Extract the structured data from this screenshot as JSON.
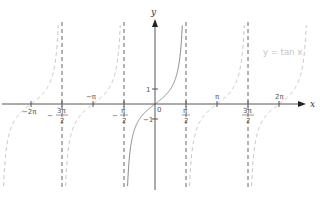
{
  "chart_data": {
    "type": "line",
    "title": "",
    "function": "y = tan x",
    "legend": "y = tan x",
    "xlabel": "x",
    "ylabel": "y",
    "x_tick_labels": [
      "−2π",
      "−3π/2",
      "−π",
      "−π/2",
      "0",
      "π/2",
      "π",
      "3π/2",
      "2π"
    ],
    "x_ticks": [
      -6.2832,
      -4.7124,
      -3.1416,
      -1.5708,
      0,
      1.5708,
      3.1416,
      4.7124,
      6.2832
    ],
    "y_tick_labels": [
      "1",
      "−1"
    ],
    "y_ticks": [
      1,
      -1
    ],
    "asymptotes": [
      -4.7124,
      -1.5708,
      1.5708,
      4.7124
    ],
    "asymptote_labels": [
      "−3π/2",
      "−π/2",
      "π/2",
      "3π/2"
    ],
    "xlim": [
      -7.5,
      8
    ],
    "ylim": [
      -6.5,
      6.5
    ],
    "grid": false,
    "legend_position": "upper right",
    "series": [
      {
        "name": "principal branch",
        "style": "solid",
        "domain": [
          -1.5708,
          1.5708
        ]
      },
      {
        "name": "other branches",
        "style": "dashed",
        "domain": [
          [
            -7.854,
            -4.7124
          ],
          [
            -4.7124,
            -1.5708
          ],
          [
            1.5708,
            4.7124
          ],
          [
            4.7124,
            7.854
          ]
        ]
      }
    ]
  },
  "labels": {
    "x_axis": "x",
    "y_axis": "y",
    "origin": "0",
    "y_one": "1",
    "y_neg_one": "−1",
    "neg_two_pi": "−2π",
    "neg_pi": "−π",
    "pi": "π",
    "two_pi": "2π",
    "neg_three_pi_num": "3π",
    "neg_pi_num": "π",
    "pi_num": "π",
    "three_pi_num": "3π",
    "den": "2",
    "minus": "−",
    "legend": "y = tan x"
  }
}
